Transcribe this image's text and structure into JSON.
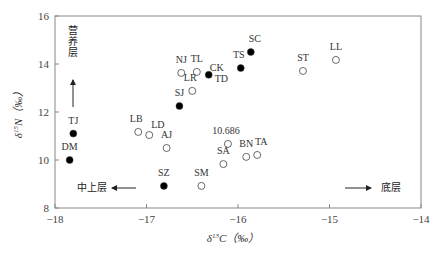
{
  "chart_data": {
    "type": "scatter",
    "title": "",
    "xlabel": "δ13C (‰)",
    "ylabel": "δ15N (‰)",
    "xlim": [
      -18,
      -14
    ],
    "ylim": [
      8,
      16
    ],
    "xticks": [
      -18,
      -17,
      -16,
      -15,
      -14
    ],
    "yticks": [
      8,
      10,
      12,
      14,
      16
    ],
    "grid": false,
    "legend": null,
    "series": [
      {
        "name": "filled",
        "marker": "filled-circle",
        "points": [
          {
            "label": "TJ",
            "x": -17.8,
            "y": 11.1
          },
          {
            "label": "DM",
            "x": -17.84,
            "y": 10.0
          },
          {
            "label": "SJ",
            "x": -16.64,
            "y": 12.25
          },
          {
            "label": "CK",
            "x": -16.32,
            "y": 13.55
          },
          {
            "label": "TS",
            "x": -15.97,
            "y": 13.83
          },
          {
            "label": "SC",
            "x": -15.86,
            "y": 14.5
          },
          {
            "label": "SZ",
            "x": -16.81,
            "y": 8.92
          }
        ]
      },
      {
        "name": "open",
        "marker": "open-circle",
        "points": [
          {
            "label": "NJ",
            "x": -16.62,
            "y": 13.63
          },
          {
            "label": "TL",
            "x": -16.45,
            "y": 13.67
          },
          {
            "label": "LR",
            "x": -16.5,
            "y": 12.88
          },
          {
            "label": "LB",
            "x": -17.09,
            "y": 11.17
          },
          {
            "label": "LD",
            "x": -16.97,
            "y": 11.04
          },
          {
            "label": "AJ",
            "x": -16.78,
            "y": 10.5
          },
          {
            "label": "10.686",
            "x": -16.11,
            "y": 10.67
          },
          {
            "label": "SA",
            "x": -16.16,
            "y": 9.83
          },
          {
            "label": "BN",
            "x": -15.91,
            "y": 10.13
          },
          {
            "label": "TA",
            "x": -15.79,
            "y": 10.21
          },
          {
            "label": "SM",
            "x": -16.4,
            "y": 8.92
          },
          {
            "label": "ST",
            "x": -15.29,
            "y": 13.71
          },
          {
            "label": "LL",
            "x": -14.93,
            "y": 14.17
          }
        ]
      }
    ],
    "annotations": [
      {
        "text": "营养层",
        "kind": "vertical-arrow-up"
      },
      {
        "text": "中上层",
        "kind": "arrow-left"
      },
      {
        "text": "底层",
        "kind": "arrow-right"
      },
      {
        "text": "TD",
        "kind": "label-near-CK"
      }
    ]
  }
}
